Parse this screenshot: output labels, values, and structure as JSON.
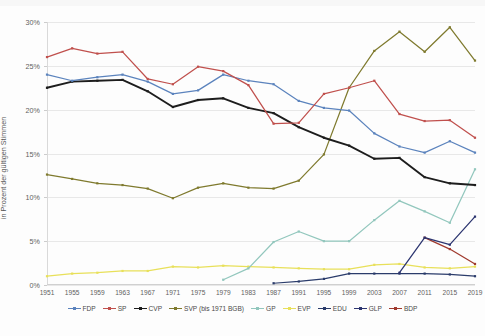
{
  "chart_data": {
    "type": "line",
    "title": "",
    "subtitle": "",
    "xlabel": "",
    "ylabel": "in Prozent der gültigen Stimmen",
    "ylim": [
      0,
      30
    ],
    "ytick_values": [
      0,
      5,
      10,
      15,
      20,
      25,
      30
    ],
    "ytick_labels": [
      "0%",
      "5%",
      "10%",
      "15%",
      "20%",
      "25%",
      "30%"
    ],
    "grid": true,
    "legend_position": "bottom",
    "x": [
      1951,
      1955,
      1959,
      1963,
      1967,
      1971,
      1975,
      1979,
      1983,
      1987,
      1991,
      1995,
      1999,
      2003,
      2007,
      2011,
      2015,
      2019
    ],
    "categories": [
      "1951",
      "1955",
      "1959",
      "1963",
      "1967",
      "1971",
      "1975",
      "1979",
      "1983",
      "1987",
      "1991",
      "1995",
      "1999",
      "2003",
      "2007",
      "2011",
      "2015",
      "2019"
    ],
    "series": [
      {
        "name": "FDP",
        "color": "#5b83bd",
        "values": [
          24.0,
          23.3,
          23.7,
          24.0,
          23.2,
          21.8,
          22.2,
          24.0,
          23.3,
          22.9,
          21.0,
          20.2,
          19.9,
          17.3,
          15.8,
          15.1,
          16.4,
          15.1
        ]
      },
      {
        "name": "SP",
        "color": "#c0504d",
        "values": [
          26.0,
          27.0,
          26.4,
          26.6,
          23.5,
          22.9,
          24.9,
          24.4,
          22.8,
          18.4,
          18.5,
          21.8,
          22.5,
          23.3,
          19.5,
          18.7,
          18.8,
          16.8
        ]
      },
      {
        "name": "CVP",
        "color": "#1d1d1d",
        "values": [
          22.5,
          23.2,
          23.3,
          23.4,
          22.1,
          20.3,
          21.1,
          21.3,
          20.2,
          19.6,
          18.0,
          16.8,
          15.9,
          14.4,
          14.5,
          12.3,
          11.6,
          11.4
        ]
      },
      {
        "name": "SVP (bis 1971 BGB)",
        "color": "#7f7a2e",
        "values": [
          12.6,
          12.1,
          11.6,
          11.4,
          11.0,
          9.9,
          11.1,
          11.6,
          11.1,
          11.0,
          11.9,
          14.9,
          22.5,
          26.7,
          28.9,
          26.6,
          29.4,
          25.6
        ]
      },
      {
        "name": "GP",
        "color": "#92c7bd",
        "values": [
          0,
          0,
          0,
          0,
          0,
          0,
          0,
          0.6,
          1.9,
          4.9,
          6.1,
          5.0,
          5.0,
          7.4,
          9.6,
          8.4,
          7.1,
          13.2
        ]
      },
      {
        "name": "EVP",
        "color": "#e8e05a",
        "values": [
          1.0,
          1.3,
          1.4,
          1.6,
          1.6,
          2.1,
          2.0,
          2.2,
          2.1,
          2.0,
          1.9,
          1.8,
          1.8,
          2.3,
          2.4,
          2.0,
          1.9,
          2.1
        ]
      },
      {
        "name": "EDU",
        "color": "#2b3c6b",
        "values": [
          0,
          0,
          0,
          0,
          0,
          0,
          0,
          0,
          0,
          0.2,
          0.4,
          0.7,
          1.3,
          1.3,
          1.3,
          1.3,
          1.2,
          1.0
        ]
      },
      {
        "name": "GLP",
        "color": "#2c3570",
        "values": [
          0,
          0,
          0,
          0,
          0,
          0,
          0,
          0,
          0,
          0,
          0,
          0,
          0,
          0,
          1.4,
          5.4,
          4.6,
          7.8
        ]
      },
      {
        "name": "BDP",
        "color": "#a03a2e",
        "values": [
          0,
          0,
          0,
          0,
          0,
          0,
          0,
          0,
          0,
          0,
          0,
          0,
          0,
          0,
          0,
          5.4,
          4.1,
          2.4
        ]
      }
    ],
    "series_start_index": {
      "FDP": 0,
      "SP": 0,
      "CVP": 0,
      "SVP (bis 1971 BGB)": 0,
      "GP": 7,
      "EVP": 0,
      "EDU": 9,
      "GLP": 14,
      "BDP": 15
    }
  },
  "legend": {
    "items": [
      {
        "label": "FDP"
      },
      {
        "label": "SP"
      },
      {
        "label": "CVP"
      },
      {
        "label": "SVP (bis 1971 BGB)"
      },
      {
        "label": "GP"
      },
      {
        "label": "EVP"
      },
      {
        "label": "EDU"
      },
      {
        "label": "GLP"
      },
      {
        "label": "BDP"
      }
    ]
  }
}
